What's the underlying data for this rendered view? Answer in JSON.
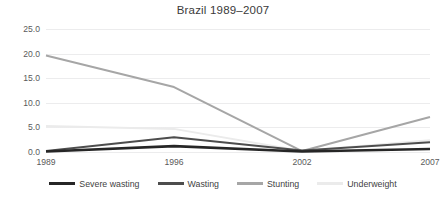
{
  "chart_data": {
    "type": "line",
    "title": "Brazil 1989–2007",
    "xlabel": "",
    "ylabel": "",
    "categories": [
      "1989",
      "1996",
      "2002",
      "2007"
    ],
    "x": [
      1989,
      1996,
      2002,
      2007
    ],
    "ylim": [
      0.0,
      25.0
    ],
    "y_ticks": [
      "0.0",
      "5.0",
      "10.0",
      "15.0",
      "20.0",
      "25.0"
    ],
    "y_tick_values": [
      0.0,
      5.0,
      10.0,
      15.0,
      20.0,
      25.0
    ],
    "grid": "horizontal",
    "legend_position": "bottom",
    "series": [
      {
        "name": "Severe wasting",
        "values": [
          0.1,
          1.2,
          0.1,
          0.6
        ],
        "color": "#262626",
        "width": 2.6
      },
      {
        "name": "Wasting",
        "values": [
          0.2,
          3.0,
          0.3,
          2.0
        ],
        "color": "#4d4d4d",
        "width": 2.0
      },
      {
        "name": "Stunting",
        "values": [
          19.6,
          13.2,
          0.2,
          7.1
        ],
        "color": "#a6a6a6",
        "width": 2.0
      },
      {
        "name": "Underweight",
        "values": [
          5.3,
          4.7,
          0.2,
          2.4
        ],
        "color": "#ebebeb",
        "width": 2.0
      }
    ]
  },
  "axis": {
    "y_labels": [
      "25.0",
      "20.0",
      "15.0",
      "10.0",
      "5.0",
      "0.0"
    ],
    "x_labels": [
      "1989",
      "1996",
      "2002",
      "2007"
    ]
  },
  "legend": {
    "items": [
      {
        "label": "Severe wasting",
        "color": "#262626"
      },
      {
        "label": "Wasting",
        "color": "#4d4d4d"
      },
      {
        "label": "Stunting",
        "color": "#a6a6a6"
      },
      {
        "label": "Underweight",
        "color": "#ebebeb"
      }
    ]
  },
  "colors": {
    "background": "#ffffff",
    "gridline": "#ececed",
    "text": "#404040"
  }
}
